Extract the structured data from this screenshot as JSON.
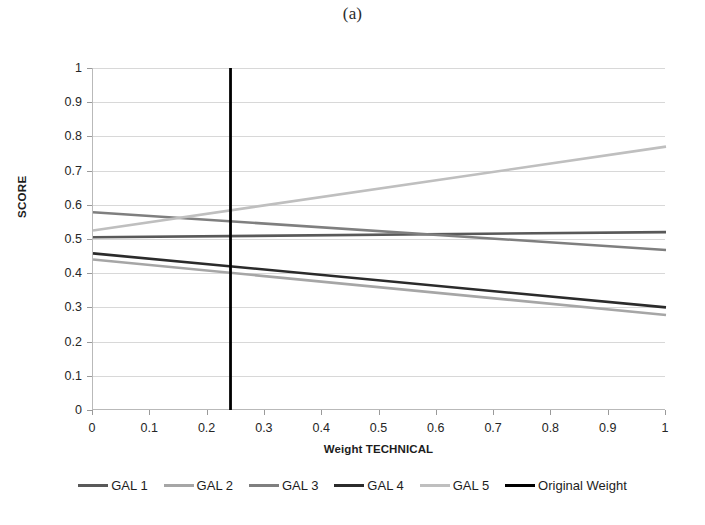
{
  "figure": {
    "title": "(a)"
  },
  "chart_data": {
    "type": "line",
    "title": "(a)",
    "xlabel": "Weight TECHNICAL",
    "ylabel": "SCORE",
    "xlim": [
      0,
      1
    ],
    "ylim": [
      0,
      1
    ],
    "grid": true,
    "legend_position": "bottom",
    "x_ticks": [
      "0",
      "0.1",
      "0.2",
      "0.3",
      "0.4",
      "0.5",
      "0.6",
      "0.7",
      "0.8",
      "0.9",
      "1"
    ],
    "x_tick_values": [
      0,
      0.1,
      0.2,
      0.3,
      0.4,
      0.5,
      0.6,
      0.7,
      0.8,
      0.9,
      1
    ],
    "y_ticks": [
      "0",
      "0.1",
      "0.2",
      "0.3",
      "0.4",
      "0.5",
      "0.6",
      "0.7",
      "0.8",
      "0.9",
      "1"
    ],
    "y_tick_values": [
      0,
      0.1,
      0.2,
      0.3,
      0.4,
      0.5,
      0.6,
      0.7,
      0.8,
      0.9,
      1
    ],
    "x": [
      0,
      1
    ],
    "series": [
      {
        "name": "GAL 1",
        "color": "#595959",
        "width": 2.6,
        "orientation": "horizontal",
        "values": [
          0.505,
          0.52
        ]
      },
      {
        "name": "GAL 2",
        "color": "#a6a6a6",
        "width": 2.6,
        "orientation": "horizontal",
        "values": [
          0.44,
          0.278
        ]
      },
      {
        "name": "GAL 3",
        "color": "#7f7f7f",
        "width": 2.6,
        "orientation": "horizontal",
        "values": [
          0.578,
          0.468
        ]
      },
      {
        "name": "GAL 4",
        "color": "#2b2b2b",
        "width": 2.6,
        "orientation": "horizontal",
        "values": [
          0.458,
          0.3
        ]
      },
      {
        "name": "GAL 5",
        "color": "#bfbfbf",
        "width": 2.6,
        "orientation": "horizontal",
        "values": [
          0.525,
          0.77
        ]
      },
      {
        "name": "Original Weight",
        "color": "#000000",
        "width": 2.8,
        "orientation": "vertical",
        "x_value": 0.24,
        "values": [
          0,
          1
        ]
      }
    ]
  }
}
